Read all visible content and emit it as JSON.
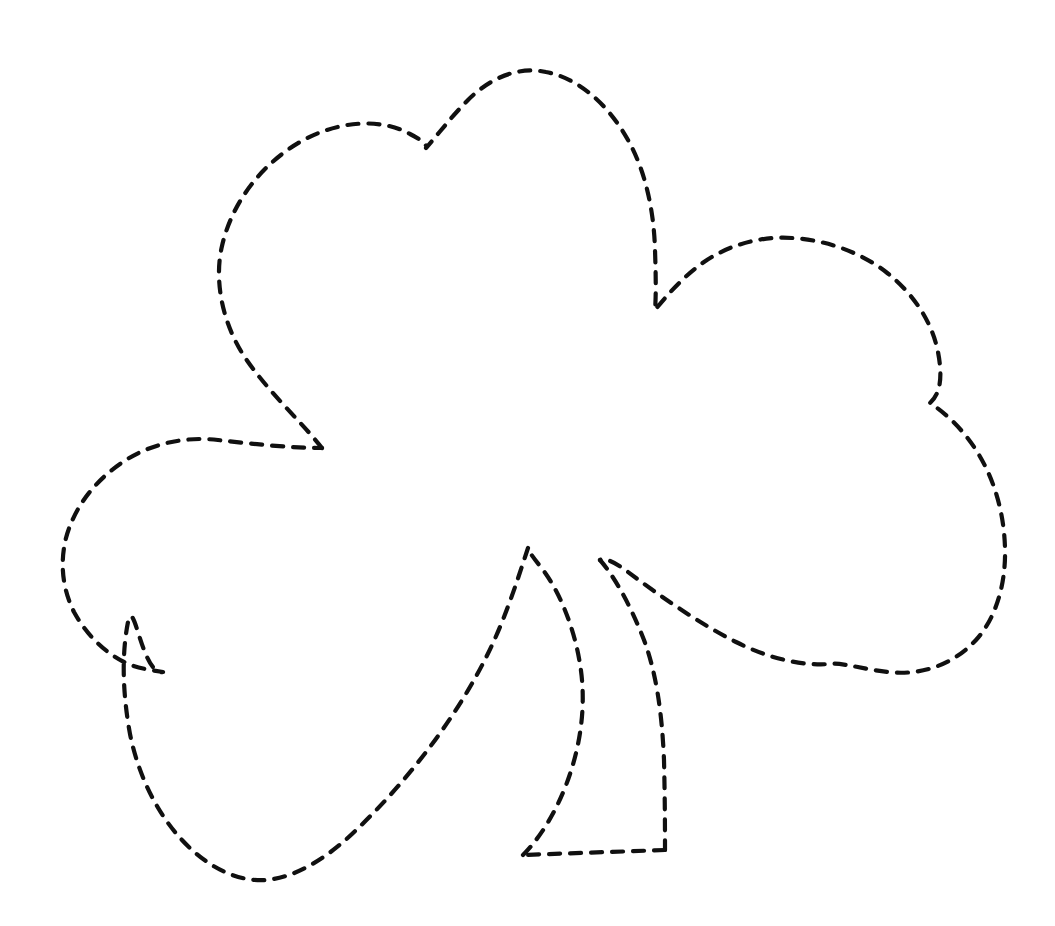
{
  "document": {
    "title": "Shamrock Dashed Outline",
    "kind": "tracing-worksheet",
    "width": 1055,
    "height": 926,
    "background_color": "#ffffff",
    "ink_color": "#101010",
    "binder_dot_color": "#c9c9cf"
  },
  "stroke": {
    "color": "#101010",
    "width": 4.2,
    "dash_pattern": "11 10",
    "linecap": "round",
    "linejoin": "round",
    "style_label": "hand-drawn dashed"
  },
  "binder_holes": {
    "name": "left-margin-dot-column",
    "x": 32,
    "first_y": 6,
    "spacing": 20,
    "count": 46,
    "diameter": 3,
    "color": "#c9c9cf"
  },
  "artwork": {
    "subject": "shamrock",
    "lobe_count": 3,
    "has_stem": true,
    "bounding_box": {
      "x": 62,
      "y": 68,
      "width": 943,
      "height": 812
    },
    "parts": [
      {
        "name": "top-left-lobe",
        "label": "Top left leaf lobe",
        "extreme_left_x": 218,
        "apex": [
          380,
          128
        ]
      },
      {
        "name": "top-right-lobe",
        "label": "Top right leaf lobe",
        "apex": [
          520,
          70
        ],
        "notch": [
          425,
          145
        ]
      },
      {
        "name": "right-lobe",
        "label": "Right leaf lobe",
        "extreme_right_x": 1005,
        "notch": [
          928,
          403
        ]
      },
      {
        "name": "left-lobe",
        "label": "Left leaf lobe",
        "extreme_left_x": 62,
        "notch": [
          163,
          672
        ]
      },
      {
        "name": "bottom-lobe",
        "label": "Bottom leaf lobe",
        "extreme_bottom_y": 880
      },
      {
        "name": "stem",
        "label": "Shamrock stem",
        "top_left_point": [
          528,
          548
        ],
        "top_right_point": [
          600,
          560
        ],
        "bottom_left_point": [
          523,
          855
        ],
        "bottom_right_point": [
          665,
          850
        ]
      }
    ],
    "paths": {
      "leaf_outline": "M 322 448 C 300 420 268 392 244 356 C 222 322 214 280 222 246 C 232 202 262 164 300 142 C 338 120 382 118 410 134 C 422 140 428 146 426 148 C 440 132 452 116 468 100 C 490 78 518 66 546 72 C 578 78 608 104 628 140 C 646 172 654 212 655 250 C 656 278 656 298 655 310 C 668 294 684 276 704 262 C 730 244 762 236 792 238 C 826 240 860 252 886 272 C 914 294 932 322 938 352 C 943 378 940 394 930 403 C 944 412 962 428 976 450 C 994 478 1004 512 1005 548 C 1006 584 996 618 976 640 C 954 664 922 676 888 672 C 862 669 840 662 830 664 C 800 666 768 658 736 642 C 700 624 660 596 628 572 C 612 560 604 558 600 560",
      "stem_right": "M 600 560 C 614 576 630 604 644 640 C 656 672 662 712 664 760 C 665 802 665 834 665 850",
      "stem_bottom": "M 665 850 L 523 855",
      "stem_inner_left": "M 523 855 C 540 838 558 810 570 774 C 582 738 586 700 580 664 C 574 626 558 588 540 566 C 532 556 528 550 528 548",
      "stem_top_to_leaf": "M 528 548 C 522 566 514 592 502 622 C 486 662 464 700 438 736 C 412 772 382 806 352 834 C 322 862 292 878 266 880 C 236 882 206 866 182 840 C 156 812 138 774 130 734 C 122 690 122 652 128 622 C 134 594 142 676 163 672 C 150 670 136 668 124 662 C 104 652 86 634 74 612 C 62 588 60 562 66 538 C 74 508 94 482 120 464 C 148 444 184 436 218 440 C 252 444 292 448 322 448"
    }
  },
  "accessibility": {
    "alt_text": "A large shamrock (three-leaf clover) outline drawn with a dashed black line on a white page, for tracing or cutting out.",
    "instruction": ""
  }
}
